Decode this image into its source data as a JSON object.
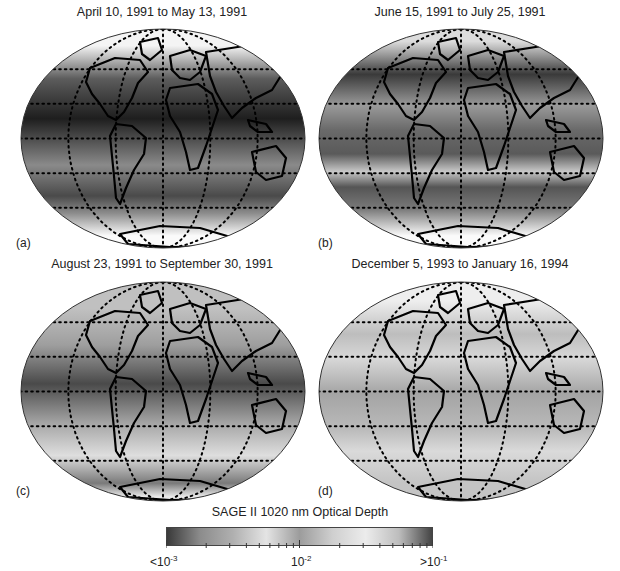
{
  "panels": [
    {
      "id": "a",
      "label": "(a)",
      "title": "April 10, 1991 to May 13, 1991",
      "bands": [
        {
          "y0": 0.0,
          "y1": 0.16,
          "shade": "#f4f4f4"
        },
        {
          "y0": 0.16,
          "y1": 0.3,
          "shade": "#5c5c5c"
        },
        {
          "y0": 0.3,
          "y1": 0.52,
          "shade": "#1e1e1e"
        },
        {
          "y0": 0.52,
          "y1": 0.72,
          "shade": "#8a8a8a"
        },
        {
          "y0": 0.72,
          "y1": 0.8,
          "shade": "#4a4a4a"
        },
        {
          "y0": 0.8,
          "y1": 0.88,
          "shade": "#8e8e8e"
        },
        {
          "y0": 0.88,
          "y1": 1.0,
          "shade": "#fafafa"
        }
      ]
    },
    {
      "id": "b",
      "label": "(b)",
      "title": "June 15, 1991 to July 25, 1991",
      "bands": [
        {
          "y0": 0.0,
          "y1": 0.12,
          "shade": "#dcdcdc"
        },
        {
          "y0": 0.12,
          "y1": 0.3,
          "shade": "#3a3a3a"
        },
        {
          "y0": 0.3,
          "y1": 0.4,
          "shade": "#9a9a9a"
        },
        {
          "y0": 0.4,
          "y1": 0.52,
          "shade": "#6a6a6a"
        },
        {
          "y0": 0.52,
          "y1": 0.62,
          "shade": "#5a5a5a"
        },
        {
          "y0": 0.62,
          "y1": 0.68,
          "shade": "#c8c8c8"
        },
        {
          "y0": 0.68,
          "y1": 0.76,
          "shade": "#555555"
        },
        {
          "y0": 0.76,
          "y1": 0.88,
          "shade": "#7a7a7a"
        },
        {
          "y0": 0.88,
          "y1": 1.0,
          "shade": "#fafafa"
        }
      ]
    },
    {
      "id": "c",
      "label": "(c)",
      "title": "August 23, 1991 to September 30, 1991",
      "bands": [
        {
          "y0": 0.0,
          "y1": 0.25,
          "shade": "#c0c0c0"
        },
        {
          "y0": 0.25,
          "y1": 0.33,
          "shade": "#9e9e9e"
        },
        {
          "y0": 0.33,
          "y1": 0.6,
          "shade": "#4a4a4a"
        },
        {
          "y0": 0.6,
          "y1": 0.7,
          "shade": "#a8a8a8"
        },
        {
          "y0": 0.7,
          "y1": 0.88,
          "shade": "#dedede"
        },
        {
          "y0": 0.88,
          "y1": 0.95,
          "shade": "#7a7a7a"
        },
        {
          "y0": 0.95,
          "y1": 1.0,
          "shade": "#e8e8e8"
        }
      ]
    },
    {
      "id": "d",
      "label": "(d)",
      "title": "December 5, 1993 to January 16, 1994",
      "bands": [
        {
          "y0": 0.0,
          "y1": 0.18,
          "shade": "#eeeeee"
        },
        {
          "y0": 0.18,
          "y1": 0.3,
          "shade": "#bdbdbd"
        },
        {
          "y0": 0.3,
          "y1": 0.4,
          "shade": "#d8d8d8"
        },
        {
          "y0": 0.4,
          "y1": 0.62,
          "shade": "#a4a4a4"
        },
        {
          "y0": 0.62,
          "y1": 0.72,
          "shade": "#bababa"
        },
        {
          "y0": 0.72,
          "y1": 0.82,
          "shade": "#dadada"
        },
        {
          "y0": 0.82,
          "y1": 1.0,
          "shade": "#c4c4c4"
        }
      ]
    }
  ],
  "colorbar": {
    "title": "SAGE II 1020 nm Optical Depth",
    "min_label_prefix": "<10",
    "min_label_exp": "-3",
    "mid_label_prefix": "10",
    "mid_label_exp": "-2",
    "max_label_prefix": ">10",
    "max_label_exp": "-1",
    "scale": "log",
    "range": [
      0.001,
      0.1
    ],
    "gradient_stops": [
      "#3a3a3a",
      "#8c8c8c",
      "#b0b0b0",
      "#e4e4e4",
      "#9c9c9c",
      "#cfcfcf",
      "#ececec",
      "#bdbdbd",
      "#444444"
    ]
  },
  "chart_data": {
    "type": "heatmap",
    "title": "SAGE II 1020 nm Optical Depth",
    "panels": [
      {
        "label": "(a)",
        "period": "April 10, 1991 to May 13, 1991"
      },
      {
        "label": "(b)",
        "period": "June 15, 1991 to July 25, 1991"
      },
      {
        "label": "(c)",
        "period": "August 23, 1991 to September 30, 1991"
      },
      {
        "label": "(d)",
        "period": "December 5, 1993 to January 16, 1994"
      }
    ],
    "colorbar": {
      "scale": "log",
      "min": "<10^-3",
      "mid": "10^-2",
      "max": ">10^-1"
    },
    "projection": "elliptical world map (Mollweide-like) with dotted graticule"
  }
}
